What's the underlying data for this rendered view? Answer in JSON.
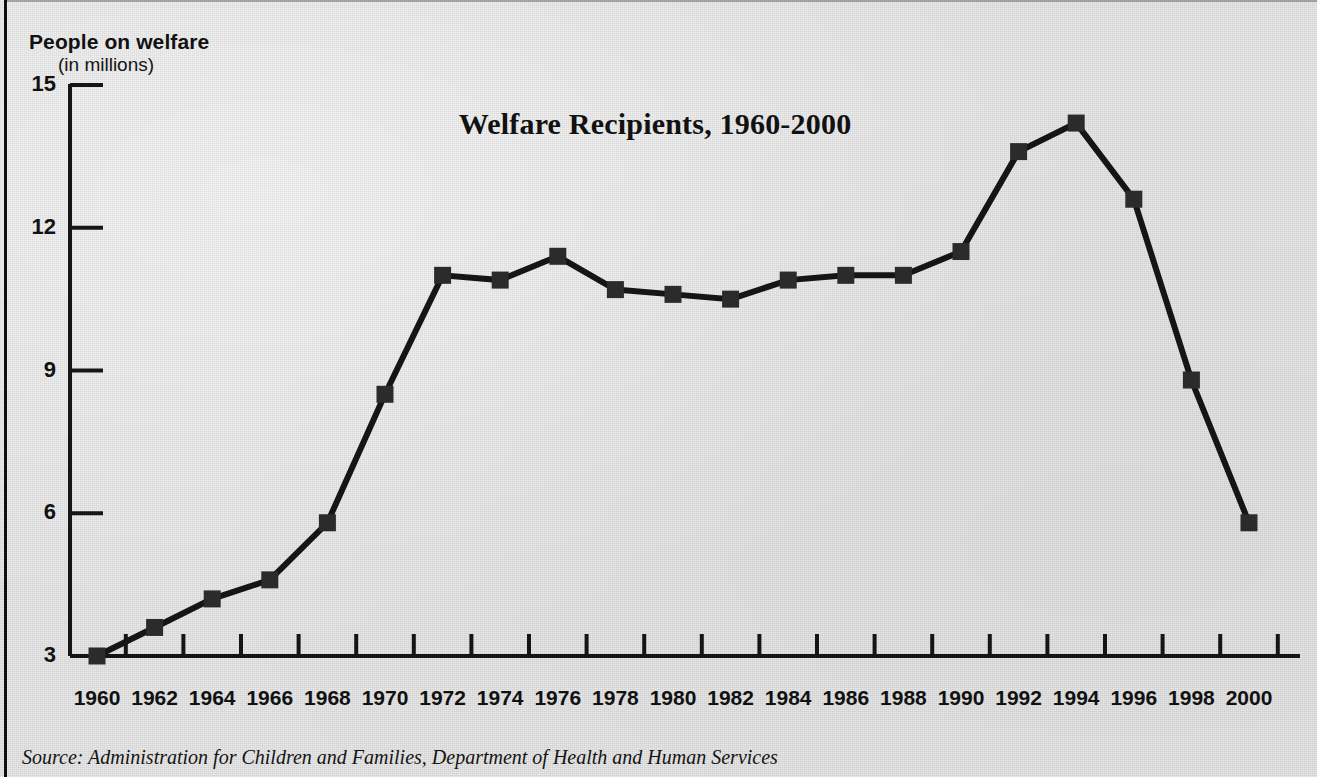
{
  "figure": {
    "background_color": "#dcdcdc",
    "ink_color": "#151515"
  },
  "axis": {
    "y_label_main": "People on welfare",
    "y_label_sub": "(in millions)",
    "y_ticks": [
      "15",
      "12",
      "9",
      "6",
      "3"
    ]
  },
  "source": {
    "text": "Source: Administration for Children and Families, Department of Health and Human Services"
  },
  "chart_data": {
    "type": "line",
    "title": "Welfare Recipients, 1960-2000",
    "xlabel": "",
    "ylabel": "People on welfare (in millions)",
    "ylim": [
      3,
      15
    ],
    "yticks": [
      3,
      6,
      9,
      12,
      15
    ],
    "grid": false,
    "legend": null,
    "marker": "square",
    "line_color": "#151515",
    "marker_color": "#2b2b2b",
    "categories": [
      "1960",
      "1962",
      "1964",
      "1966",
      "1968",
      "1970",
      "1972",
      "1974",
      "1976",
      "1978",
      "1980",
      "1982",
      "1984",
      "1986",
      "1988",
      "1990",
      "1992",
      "1994",
      "1996",
      "1998",
      "2000"
    ],
    "x": [
      1960,
      1962,
      1964,
      1966,
      1968,
      1970,
      1972,
      1974,
      1976,
      1978,
      1980,
      1982,
      1984,
      1986,
      1988,
      1990,
      1992,
      1994,
      1996,
      1998,
      2000
    ],
    "values": [
      3.0,
      3.6,
      4.2,
      4.6,
      5.8,
      8.5,
      11.0,
      10.9,
      11.4,
      10.7,
      10.6,
      10.5,
      10.9,
      11.0,
      11.0,
      11.5,
      13.6,
      14.2,
      12.6,
      8.8,
      5.8
    ],
    "series": [
      {
        "name": "People on welfare (in millions)",
        "values": [
          3.0,
          3.6,
          4.2,
          4.6,
          5.8,
          8.5,
          11.0,
          10.9,
          11.4,
          10.7,
          10.6,
          10.5,
          10.9,
          11.0,
          11.0,
          11.5,
          13.6,
          14.2,
          12.6,
          8.8,
          5.8
        ]
      }
    ]
  },
  "geometry": {
    "plot_left": 70,
    "plot_right": 1300,
    "plot_top": 85,
    "plot_bottom": 656,
    "x_first": 97,
    "x_step": 57.6,
    "marker_size": 17,
    "line_width": 6
  }
}
